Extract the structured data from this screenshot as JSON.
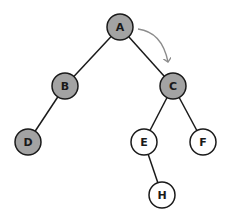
{
  "diagram": {
    "type": "binary-tree",
    "colors": {
      "visited_fill": "#a3a3a3",
      "unvisited_fill": "#ffffff",
      "stroke": "#1a1a1a",
      "arrow": "#8c8c8c"
    },
    "nodes": [
      {
        "id": "A",
        "label": "A",
        "x": 120,
        "y": 27,
        "visited": true
      },
      {
        "id": "B",
        "label": "B",
        "x": 65,
        "y": 86,
        "visited": true
      },
      {
        "id": "C",
        "label": "C",
        "x": 173,
        "y": 86,
        "visited": true
      },
      {
        "id": "D",
        "label": "D",
        "x": 28,
        "y": 142,
        "visited": true
      },
      {
        "id": "E",
        "label": "E",
        "x": 144,
        "y": 142,
        "visited": false
      },
      {
        "id": "F",
        "label": "F",
        "x": 203,
        "y": 142,
        "visited": false
      },
      {
        "id": "H",
        "label": "H",
        "x": 162,
        "y": 195,
        "visited": false
      }
    ],
    "edges": [
      {
        "from": "A",
        "to": "B"
      },
      {
        "from": "A",
        "to": "C"
      },
      {
        "from": "B",
        "to": "D"
      },
      {
        "from": "C",
        "to": "E"
      },
      {
        "from": "C",
        "to": "F"
      },
      {
        "from": "E",
        "to": "H"
      }
    ],
    "arrow": {
      "from": "A",
      "to": "C",
      "label": ""
    }
  }
}
